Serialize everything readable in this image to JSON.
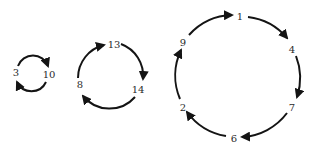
{
  "diagram": {
    "type": "permutation-cycles",
    "stroke_color": "#141414",
    "label_color": "#2a2a2a",
    "cycles": [
      {
        "name": "cycle-2",
        "nodes": [
          "3",
          "10"
        ],
        "labels": [
          {
            "text": "3",
            "x": 16,
            "y": 76
          },
          {
            "text": "10",
            "x": 49,
            "y": 78
          }
        ]
      },
      {
        "name": "cycle-3",
        "nodes": [
          "13",
          "14",
          "8"
        ],
        "labels": [
          {
            "text": "13",
            "x": 114,
            "y": 48
          },
          {
            "text": "14",
            "x": 138,
            "y": 93
          },
          {
            "text": "8",
            "x": 80,
            "y": 88
          }
        ]
      },
      {
        "name": "cycle-6",
        "nodes": [
          "1",
          "4",
          "7",
          "6",
          "2",
          "9"
        ],
        "labels": [
          {
            "text": "1",
            "x": 240,
            "y": 20
          },
          {
            "text": "4",
            "x": 292,
            "y": 53
          },
          {
            "text": "7",
            "x": 292,
            "y": 111
          },
          {
            "text": "6",
            "x": 234,
            "y": 142
          },
          {
            "text": "2",
            "x": 183,
            "y": 111
          },
          {
            "text": "9",
            "x": 183,
            "y": 46
          }
        ]
      }
    ]
  }
}
